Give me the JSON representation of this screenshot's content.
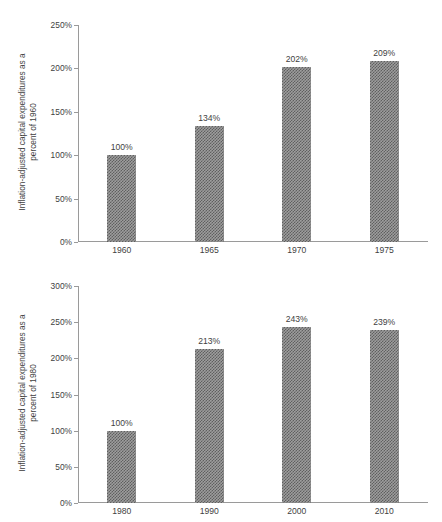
{
  "figure": {
    "background": "#ffffff",
    "bar_color": "#6e6e6e",
    "axis_color": "#9a9a9a",
    "text_color": "#3f3f3f"
  },
  "chart_data": [
    {
      "type": "bar",
      "id": "capital-expenditures-1960-base",
      "title": "",
      "xlabel": "",
      "ylabel": "Inflation-adjusted capital expenditures as a\npercent of 1960",
      "categories": [
        "1960",
        "1965",
        "1970",
        "1975"
      ],
      "values": [
        100,
        134,
        202,
        209
      ],
      "value_labels": [
        "100%",
        "134%",
        "202%",
        "209%"
      ],
      "ylim": [
        0,
        250
      ],
      "yticks": [
        0,
        50,
        100,
        150,
        200,
        250
      ],
      "ytick_labels": [
        "0%",
        "50%",
        "100%",
        "150%",
        "200%",
        "250%"
      ],
      "grid": false,
      "legend": "none"
    },
    {
      "type": "bar",
      "id": "capital-expenditures-1980-base",
      "title": "",
      "xlabel": "",
      "ylabel": "Inflation-adjusted capital expenditures as a\npercent of 1980",
      "categories": [
        "1980",
        "1990",
        "2000",
        "2010"
      ],
      "values": [
        100,
        213,
        243,
        239
      ],
      "value_labels": [
        "100%",
        "213%",
        "243%",
        "239%"
      ],
      "ylim": [
        0,
        300
      ],
      "yticks": [
        0,
        50,
        100,
        150,
        200,
        250,
        300
      ],
      "ytick_labels": [
        "0%",
        "50%",
        "100%",
        "150%",
        "200%",
        "250%",
        "300%"
      ],
      "grid": false,
      "legend": "none"
    }
  ]
}
